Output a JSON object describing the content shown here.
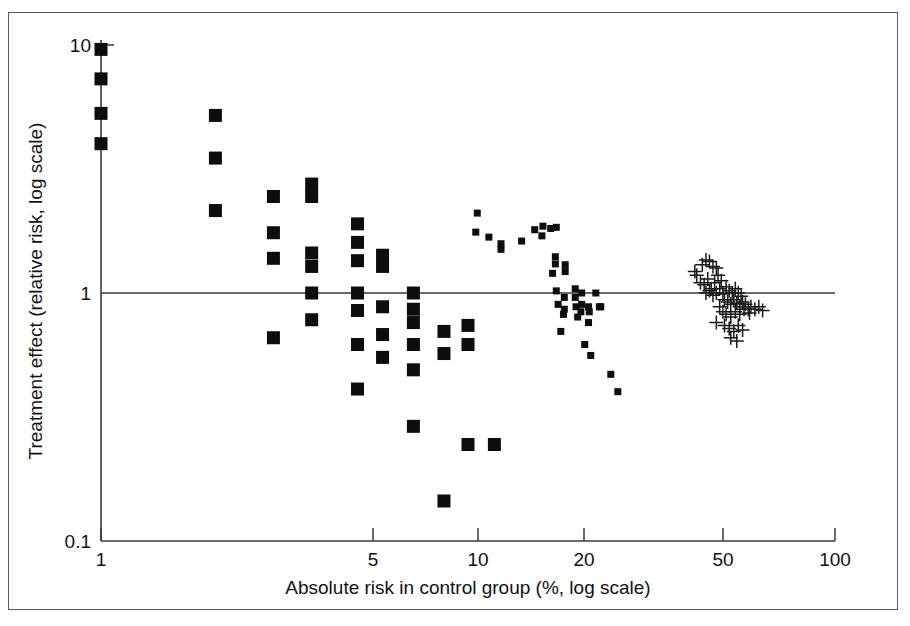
{
  "chart_data": {
    "type": "scatter",
    "title": "",
    "xlabel": "Absolute risk in control group (%, log scale)",
    "ylabel": "Treatment effect (relative risk, log scale)",
    "xscale": "log",
    "yscale": "log",
    "xlim": [
      1,
      100
    ],
    "ylim": [
      0.1,
      10
    ],
    "xticks": [
      1,
      5,
      10,
      20,
      50,
      100
    ],
    "xticklabels": [
      "1",
      "5",
      "10",
      "20",
      "50",
      "100"
    ],
    "yticks": [
      0.1,
      1,
      10
    ],
    "yticklabels": [
      "0.1",
      "1",
      "10"
    ],
    "grid": false,
    "legend": null,
    "reference_line": {
      "y": 1,
      "orientation": "horizontal",
      "label": "no effect"
    },
    "series": [
      {
        "name": "large-squares",
        "marker": "filled-square-large",
        "color": "#0d0d0d",
        "points": [
          [
            1.0,
            9.6
          ],
          [
            1.0,
            7.3
          ],
          [
            1.0,
            5.3
          ],
          [
            1.0,
            4.0
          ],
          [
            2.05,
            5.2
          ],
          [
            2.05,
            3.5
          ],
          [
            2.05,
            2.15
          ],
          [
            2.95,
            2.45
          ],
          [
            2.95,
            1.75
          ],
          [
            2.95,
            1.38
          ],
          [
            2.95,
            0.66
          ],
          [
            3.75,
            2.75
          ],
          [
            3.75,
            2.45
          ],
          [
            3.75,
            1.45
          ],
          [
            3.75,
            1.28
          ],
          [
            3.75,
            1.0
          ],
          [
            3.75,
            0.78
          ],
          [
            5.0,
            1.9
          ],
          [
            5.0,
            1.6
          ],
          [
            5.0,
            1.35
          ],
          [
            5.0,
            1.0
          ],
          [
            5.0,
            0.85
          ],
          [
            5.0,
            0.62
          ],
          [
            5.0,
            0.41
          ],
          [
            5.85,
            1.42
          ],
          [
            5.85,
            1.28
          ],
          [
            5.85,
            0.88
          ],
          [
            5.85,
            0.68
          ],
          [
            5.85,
            0.55
          ],
          [
            7.1,
            1.0
          ],
          [
            7.1,
            0.86
          ],
          [
            7.1,
            0.76
          ],
          [
            7.1,
            0.62
          ],
          [
            7.1,
            0.49
          ],
          [
            7.1,
            0.29
          ],
          [
            8.6,
            0.7
          ],
          [
            8.6,
            0.57
          ],
          [
            8.6,
            0.145
          ],
          [
            10.0,
            0.74
          ],
          [
            10.0,
            0.62
          ],
          [
            10.0,
            0.245
          ],
          [
            11.8,
            0.245
          ]
        ]
      },
      {
        "name": "small-squares",
        "marker": "filled-square-small",
        "color": "#0d0d0d",
        "points": [
          [
            10.6,
            2.1
          ],
          [
            10.5,
            1.76
          ],
          [
            11.4,
            1.68
          ],
          [
            12.3,
            1.58
          ],
          [
            12.3,
            1.5
          ],
          [
            14.0,
            1.62
          ],
          [
            15.2,
            1.8
          ],
          [
            16.0,
            1.86
          ],
          [
            15.9,
            1.7
          ],
          [
            16.8,
            1.82
          ],
          [
            17.4,
            1.84
          ],
          [
            17.3,
            1.4
          ],
          [
            17.3,
            1.31
          ],
          [
            17.0,
            1.2
          ],
          [
            17.4,
            1.02
          ],
          [
            18.4,
            1.3
          ],
          [
            18.4,
            1.22
          ],
          [
            18.3,
            0.96
          ],
          [
            18.3,
            0.86
          ],
          [
            18.2,
            0.82
          ],
          [
            17.6,
            0.9
          ],
          [
            17.9,
            0.7
          ],
          [
            19.6,
            1.04
          ],
          [
            19.6,
            0.96
          ],
          [
            19.7,
            0.88
          ],
          [
            19.9,
            0.8
          ],
          [
            20.4,
            1.0
          ],
          [
            20.4,
            0.9
          ],
          [
            20.3,
            0.84
          ],
          [
            21.3,
            0.88
          ],
          [
            21.4,
            0.84
          ],
          [
            21.3,
            0.76
          ],
          [
            22.3,
            1.0
          ],
          [
            22.8,
            0.88
          ],
          [
            23.0,
            0.88
          ],
          [
            21.6,
            0.56
          ],
          [
            24.5,
            0.47
          ],
          [
            25.6,
            0.4
          ],
          [
            20.8,
            0.62
          ]
        ]
      },
      {
        "name": "crosses",
        "marker": "plus",
        "color": "#1a1a1a",
        "points": [
          [
            41.5,
            1.22
          ],
          [
            42.0,
            1.18
          ],
          [
            43.5,
            1.3
          ],
          [
            44.5,
            1.36
          ],
          [
            45.5,
            1.34
          ],
          [
            46.5,
            1.28
          ],
          [
            47.5,
            1.26
          ],
          [
            43.0,
            1.1
          ],
          [
            44.0,
            1.08
          ],
          [
            45.0,
            1.14
          ],
          [
            46.0,
            1.04
          ],
          [
            47.0,
            1.1
          ],
          [
            48.0,
            1.18
          ],
          [
            49.0,
            1.12
          ],
          [
            44.5,
            1.0
          ],
          [
            45.5,
            1.02
          ],
          [
            46.5,
            0.98
          ],
          [
            47.5,
            1.0
          ],
          [
            48.5,
            1.04
          ],
          [
            49.5,
            0.99
          ],
          [
            50.5,
            1.06
          ],
          [
            51.5,
            1.02
          ],
          [
            52.5,
            1.0
          ],
          [
            53.5,
            1.04
          ],
          [
            54.5,
            1.0
          ],
          [
            55.5,
            0.97
          ],
          [
            50.0,
            0.94
          ],
          [
            51.0,
            0.92
          ],
          [
            52.0,
            0.9
          ],
          [
            53.0,
            0.94
          ],
          [
            54.0,
            0.91
          ],
          [
            55.0,
            0.88
          ],
          [
            56.0,
            0.92
          ],
          [
            57.0,
            0.9
          ],
          [
            58.0,
            0.86
          ],
          [
            59.0,
            0.88
          ],
          [
            48.5,
            0.88
          ],
          [
            49.5,
            0.84
          ],
          [
            50.5,
            0.82
          ],
          [
            52.0,
            0.8
          ],
          [
            53.5,
            0.84
          ],
          [
            55.0,
            0.82
          ],
          [
            56.5,
            0.86
          ],
          [
            58.5,
            0.83
          ],
          [
            60.5,
            0.86
          ],
          [
            62.0,
            0.88
          ],
          [
            63.5,
            0.85
          ],
          [
            50.0,
            0.74
          ],
          [
            51.5,
            0.72
          ],
          [
            53.0,
            0.7
          ],
          [
            54.5,
            0.74
          ],
          [
            56.0,
            0.71
          ],
          [
            47.5,
            0.76
          ],
          [
            52.0,
            0.66
          ],
          [
            54.0,
            0.64
          ]
        ]
      }
    ]
  },
  "axes": {
    "x_label": "Absolute risk in control group (%, log scale)",
    "y_label": "Treatment effect (relative risk, log scale)",
    "x_tick_labels": [
      "1",
      "5",
      "10",
      "20",
      "50",
      "100"
    ],
    "y_tick_labels": [
      "10",
      "1",
      "0.1"
    ]
  }
}
